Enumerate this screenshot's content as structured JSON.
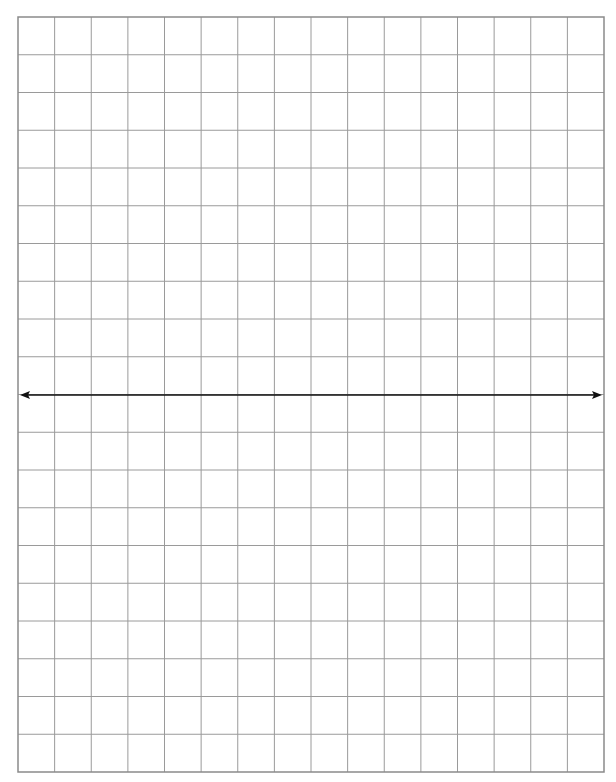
{
  "diagram": {
    "type": "grid-with-number-line",
    "grid": {
      "left": 18,
      "top": 17,
      "right": 604,
      "bottom": 772,
      "columns": 16,
      "rows": 20,
      "line_color": "#9a9a9a",
      "border_color": "#8a8a8a"
    },
    "arrow": {
      "y": 395,
      "x_start": 20,
      "x_end": 602,
      "color": "#111111",
      "direction": "double-headed",
      "label": ""
    }
  }
}
